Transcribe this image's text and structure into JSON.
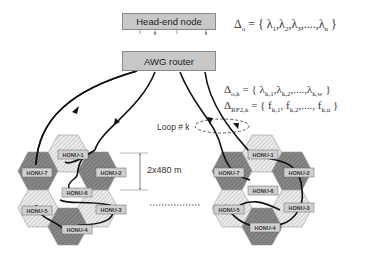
{
  "nodes": {
    "head_end": "Head-end node",
    "awg_router": "AWG router"
  },
  "equations": {
    "delta_o": "Δo = { λ1, λ2, λ3, ...., λn }",
    "delta_ok": "Δo,k = { λk,1, λk,2, ...., λk,w }",
    "delta_rf2k": "ΔRF2,k = { fk,1, fk,2, ...., fk,u }"
  },
  "labels": {
    "loop": "Loop # k",
    "distance": "2x480 m",
    "ellipsis": "..........."
  },
  "clusters": [
    {
      "name": "left",
      "honus": [
        "HONU-1",
        "HONU-2",
        "HONU-3",
        "HONU-4",
        "HONU-5",
        "HONU-6",
        "HONU-7"
      ]
    },
    {
      "name": "right",
      "honus": [
        "HONU-1",
        "HONU-2",
        "HONU-3",
        "HONU-4",
        "HONU-5",
        "HONU-6",
        "HONU-7"
      ]
    }
  ],
  "colors": {
    "box_fill": "#c8c8c8",
    "hex_light": "#e6e6e6",
    "hex_dark": "#7a7a7a",
    "line": "#111111"
  }
}
